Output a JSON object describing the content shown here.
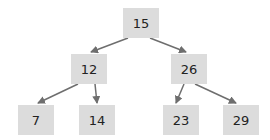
{
  "diagram": {
    "type": "binary-search-tree",
    "colors": {
      "node_fill": "#dcdcdc",
      "edge": "#6e6e6e",
      "text": "#222222"
    },
    "nodes": [
      {
        "id": "n15",
        "label": "15",
        "x": 123,
        "y": 8
      },
      {
        "id": "n12",
        "label": "12",
        "x": 71,
        "y": 54
      },
      {
        "id": "n26",
        "label": "26",
        "x": 171,
        "y": 54
      },
      {
        "id": "n7",
        "label": "7",
        "x": 18,
        "y": 105
      },
      {
        "id": "n14",
        "label": "14",
        "x": 79,
        "y": 105
      },
      {
        "id": "n23",
        "label": "23",
        "x": 163,
        "y": 105
      },
      {
        "id": "n29",
        "label": "29",
        "x": 223,
        "y": 105
      }
    ],
    "edges": [
      {
        "from": "15",
        "to": "12"
      },
      {
        "from": "15",
        "to": "26"
      },
      {
        "from": "12",
        "to": "7"
      },
      {
        "from": "12",
        "to": "14"
      },
      {
        "from": "26",
        "to": "23"
      },
      {
        "from": "26",
        "to": "29"
      }
    ]
  }
}
